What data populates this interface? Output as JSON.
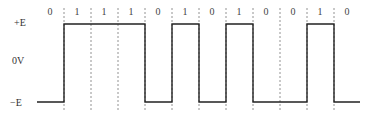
{
  "diagram": {
    "type": "polar NRZ digital waveform",
    "levels": {
      "high": "+E",
      "zero": "0V",
      "low": "−E"
    },
    "bits": [
      "0",
      "1",
      "1",
      "1",
      "0",
      "1",
      "0",
      "1",
      "0",
      "0",
      "1",
      "0"
    ]
  }
}
